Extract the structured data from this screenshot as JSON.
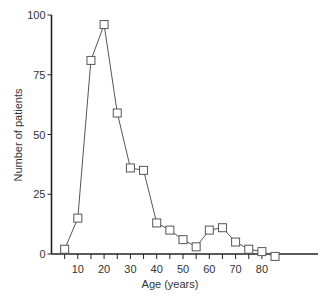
{
  "chart_data": {
    "type": "line",
    "title": "",
    "xlabel": "Age (years)",
    "ylabel": "Number of patients",
    "x_tick_labels": [
      "10",
      "20",
      "30",
      "40",
      "50",
      "60",
      "70",
      "80"
    ],
    "x_ticks": [
      10,
      20,
      30,
      40,
      50,
      60,
      70,
      80
    ],
    "y_tick_labels": [
      "0",
      "25",
      "50",
      "75",
      "100"
    ],
    "y_ticks": [
      0,
      25,
      50,
      75,
      100
    ],
    "xlim": [
      0,
      100
    ],
    "ylim": [
      0,
      100
    ],
    "grid": false,
    "legend": null,
    "marker": "open-square",
    "series": [
      {
        "name": "Number of patients",
        "x": [
          5,
          10,
          15,
          20,
          25,
          30,
          35,
          40,
          45,
          50,
          55,
          60,
          65,
          70,
          75,
          80,
          85
        ],
        "values": [
          2,
          15,
          81,
          96,
          59,
          36,
          35,
          13,
          10,
          6,
          3,
          10,
          11,
          5,
          2,
          1,
          -1
        ]
      }
    ]
  },
  "style": {
    "line_color": "#555555",
    "axis_color": "#222222",
    "marker_fill": "#ffffff"
  }
}
